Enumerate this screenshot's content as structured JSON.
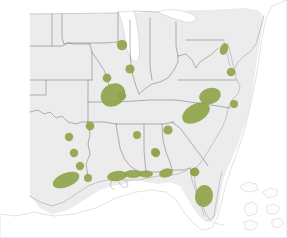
{
  "figure": {
    "type": "distribution-map",
    "width_px": 287,
    "height_px": 238
  },
  "colors": {
    "background": "#ffffff",
    "land_fill": "#ececec",
    "state_border": "#6d6d6d",
    "coast_line": "#9a9a9a",
    "water_fill": "#ffffff",
    "range_green": "#8fa44a",
    "island_stroke": "#bdbdbd"
  },
  "legend": {
    "present": false,
    "items": []
  },
  "labels": {
    "present": false,
    "items": []
  },
  "water_bodies": [
    {
      "name": "lake-michigan",
      "label": "Lake Michigan"
    },
    {
      "name": "lake-erie",
      "label": "Lake Erie"
    },
    {
      "name": "atlantic-ocean",
      "label": "Atlantic Ocean"
    },
    {
      "name": "gulf-of-mexico",
      "label": "Gulf of Mexico"
    }
  ],
  "islands": [
    {
      "name": "bahamas-islands",
      "label": "Bahamas"
    },
    {
      "name": "florida-keys",
      "label": "Florida Keys"
    }
  ],
  "range_markers": [
    {
      "id": "northern-illinois",
      "label": "Northern Illinois",
      "kind": "dot",
      "cx": 122,
      "cy": 45,
      "r": 5.2
    },
    {
      "id": "central-illinois",
      "label": "Central Illinois",
      "kind": "dot",
      "cx": 130,
      "cy": 69,
      "r": 4.6
    },
    {
      "id": "central-missouri",
      "label": "Central Missouri",
      "kind": "dot",
      "cx": 107,
      "cy": 78,
      "r": 4.4
    },
    {
      "id": "missouri-bootheel-delta",
      "label": "Missouri Bootheel and Mississippi Delta",
      "kind": "blob",
      "cx": 113,
      "cy": 95,
      "rx": 13,
      "ry": 11,
      "rot": -38
    },
    {
      "id": "western-tennessee",
      "label": "Western Tennessee",
      "kind": "dot",
      "cx": 122,
      "cy": 96,
      "r": 4.2
    },
    {
      "id": "southern-arkansas",
      "label": "Southern Arkansas",
      "kind": "dot",
      "cx": 90,
      "cy": 126,
      "r": 4.4
    },
    {
      "id": "east-texas",
      "label": "East Texas",
      "kind": "dot",
      "cx": 69,
      "cy": 137,
      "r": 4.2
    },
    {
      "id": "northeast-texas-border",
      "label": "Northeast Texas border",
      "kind": "dot",
      "cx": 74,
      "cy": 153,
      "r": 4.2
    },
    {
      "id": "southeast-texas",
      "label": "Southeast Texas",
      "kind": "dot",
      "cx": 80,
      "cy": 166,
      "r": 4.2
    },
    {
      "id": "houston-coastal-plain",
      "label": "Houston coastal plain",
      "kind": "blob",
      "cx": 66,
      "cy": 180,
      "rx": 14,
      "ry": 7,
      "rot": -22
    },
    {
      "id": "southwest-louisiana",
      "label": "Southwest Louisiana",
      "kind": "dot",
      "cx": 88,
      "cy": 178,
      "r": 4.0
    },
    {
      "id": "louisiana-gulf-coast",
      "label": "Louisiana Gulf Coast",
      "kind": "blob",
      "cx": 117,
      "cy": 176,
      "rx": 10,
      "ry": 5,
      "rot": -8
    },
    {
      "id": "mississippi-gulf-coast",
      "label": "Mississippi Gulf Coast",
      "kind": "blob",
      "cx": 133,
      "cy": 174,
      "rx": 9,
      "ry": 4,
      "rot": 0
    },
    {
      "id": "alabama-gulf-coast",
      "label": "Alabama Gulf Coast",
      "kind": "blob",
      "cx": 146,
      "cy": 174,
      "rx": 7,
      "ry": 3.5,
      "rot": 0
    },
    {
      "id": "central-mississippi",
      "label": "Central Mississippi",
      "kind": "dot",
      "cx": 137,
      "cy": 135,
      "r": 4.0
    },
    {
      "id": "central-alabama",
      "label": "Central Alabama",
      "kind": "dot",
      "cx": 156,
      "cy": 153,
      "r": 4.2
    },
    {
      "id": "northern-georgia",
      "label": "Northern Georgia",
      "kind": "dot",
      "cx": 168,
      "cy": 130,
      "r": 4.6
    },
    {
      "id": "southern-georgia",
      "label": "Southern Georgia",
      "kind": "dot",
      "cx": 155,
      "cy": 152,
      "r": 4.0
    },
    {
      "id": "florida-panhandle",
      "label": "Florida Panhandle",
      "kind": "blob",
      "cx": 166,
      "cy": 173,
      "rx": 7,
      "ry": 4.5,
      "rot": -14
    },
    {
      "id": "north-central-florida",
      "label": "North central Florida",
      "kind": "dot",
      "cx": 195,
      "cy": 172,
      "r": 4.4
    },
    {
      "id": "tampa-bay-florida",
      "label": "Tampa Bay region, Florida",
      "kind": "blob",
      "cx": 204,
      "cy": 196,
      "rx": 9,
      "ry": 11,
      "rot": 10
    },
    {
      "id": "southeast-georgia-coast",
      "label": "Southeast Georgia coast",
      "kind": "dot",
      "cx": 194,
      "cy": 172,
      "r": 4.0
    },
    {
      "id": "south-carolina-coastal-plain",
      "label": "South Carolina coastal plain",
      "kind": "blob",
      "cx": 196,
      "cy": 113,
      "rx": 15,
      "ry": 9,
      "rot": -30
    },
    {
      "id": "north-carolina-piedmont",
      "label": "North Carolina piedmont",
      "kind": "blob",
      "cx": 210,
      "cy": 96,
      "rx": 11,
      "ry": 8,
      "rot": -15
    },
    {
      "id": "coastal-north-carolina",
      "label": "Coastal North Carolina",
      "kind": "dot",
      "cx": 234,
      "cy": 104,
      "r": 4.0
    },
    {
      "id": "southeastern-virginia",
      "label": "Southeastern Virginia",
      "kind": "dot",
      "cx": 231,
      "cy": 72,
      "r": 4.2
    },
    {
      "id": "chesapeake-maryland",
      "label": "Chesapeake Bay, Maryland",
      "kind": "blob",
      "cx": 224,
      "cy": 49,
      "rx": 4,
      "ry": 6,
      "rot": 20
    }
  ]
}
